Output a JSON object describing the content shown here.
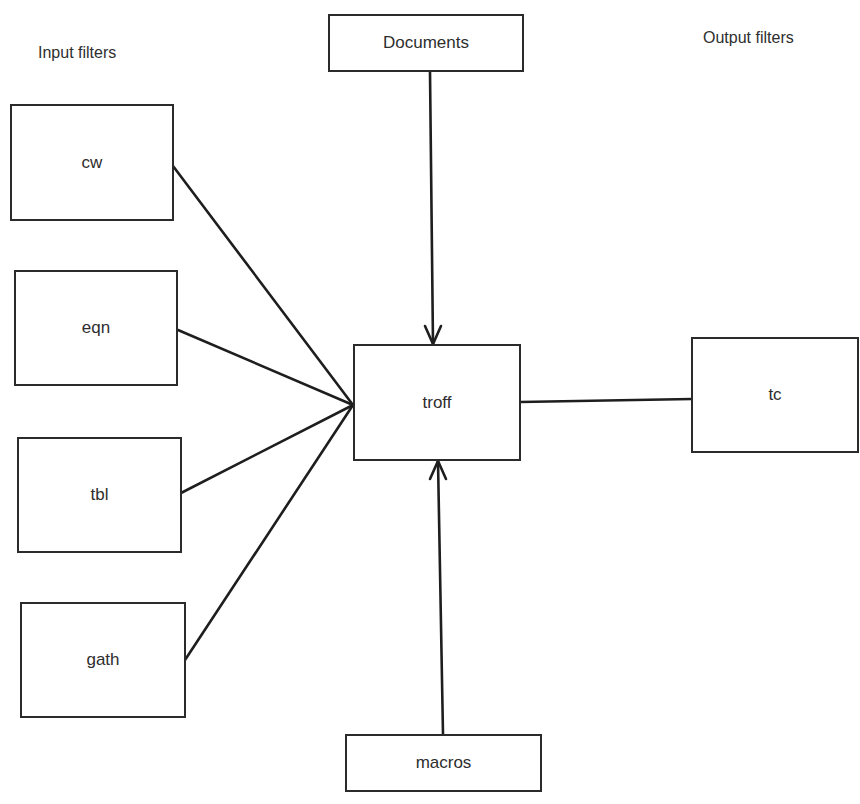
{
  "labels": {
    "input_filters": "Input filters",
    "output_filters": "Output filters"
  },
  "nodes": {
    "documents": "Documents",
    "cw": "cw",
    "eqn": "eqn",
    "tbl": "tbl",
    "gath": "gath",
    "troff": "troff",
    "tc": "tc",
    "macros": "macros"
  },
  "edges": [
    {
      "from": "documents",
      "to": "troff",
      "arrow": true
    },
    {
      "from": "macros",
      "to": "troff",
      "arrow": true
    },
    {
      "from": "cw",
      "to": "troff",
      "arrow": false
    },
    {
      "from": "eqn",
      "to": "troff",
      "arrow": false
    },
    {
      "from": "tbl",
      "to": "troff",
      "arrow": false
    },
    {
      "from": "gath",
      "to": "troff",
      "arrow": false
    },
    {
      "from": "troff",
      "to": "tc",
      "arrow": false
    }
  ],
  "colors": {
    "line": "#1e1e1e",
    "background": "#ffffff"
  }
}
